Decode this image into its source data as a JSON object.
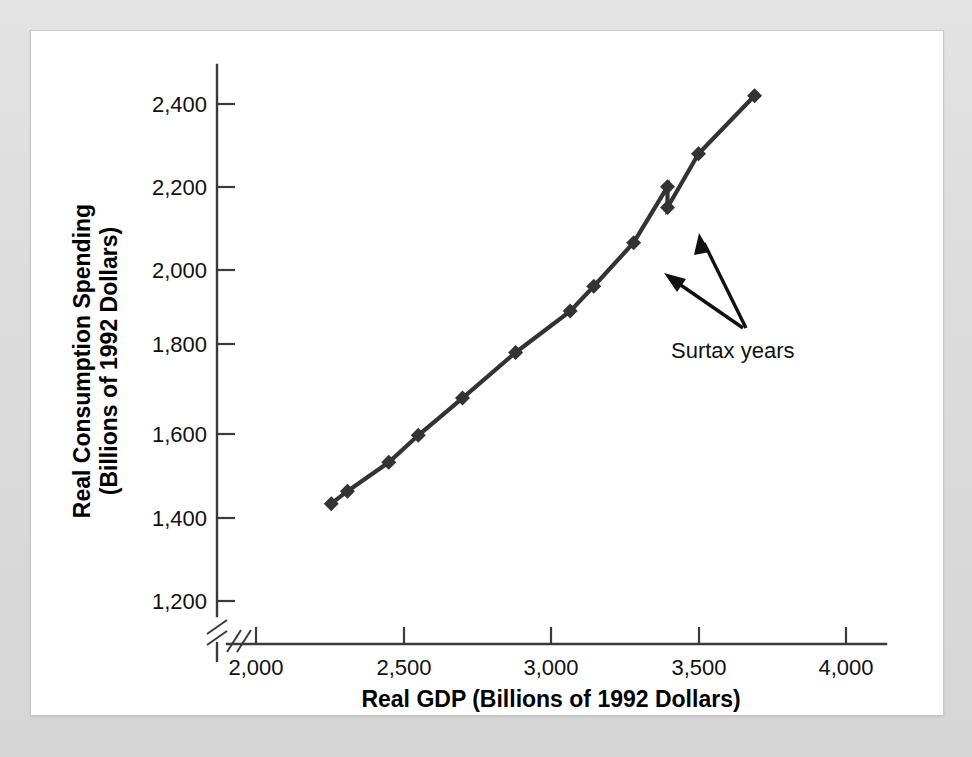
{
  "figure": {
    "background_color": "#d9d9d9",
    "panel_color": "#ffffff",
    "series_color": "#333333"
  },
  "axes": {
    "x_title": "Real GDP (Billions of 1992 Dollars)",
    "y_title_line1": "Real Consumption Spending",
    "y_title_line2": "(Billions of 1992 Dollars)",
    "x_ticks": [
      "2,000",
      "2,500",
      "3,000",
      "3,500",
      "4,000"
    ],
    "y_ticks": [
      "2,400",
      "2,200",
      "2,000",
      "1,800",
      "1,600",
      "1,400",
      "1,200"
    ]
  },
  "annotations": [
    {
      "text": "Surtax years"
    }
  ],
  "chart_data": {
    "type": "line",
    "title": "",
    "xlabel": "Real GDP (Billions of 1992 Dollars)",
    "ylabel": "Real Consumption Spending (Billions of 1992 Dollars)",
    "xlim": [
      2000,
      4000
    ],
    "ylim": [
      1200,
      2500
    ],
    "x_ticks": [
      2000,
      2500,
      3000,
      3500,
      4000
    ],
    "y_ticks": [
      1200,
      1400,
      1600,
      1800,
      2000,
      2200,
      2400
    ],
    "axis_break": {
      "x": true,
      "y": true
    },
    "grid": false,
    "legend": "none",
    "marker": "diamond",
    "series": [
      {
        "name": "Consumption function",
        "x": [
          2255,
          2310,
          2450,
          2550,
          2700,
          2880,
          3065,
          3145,
          3280,
          3395,
          3395,
          3500,
          3690
        ],
        "y": [
          1435,
          1465,
          1535,
          1600,
          1690,
          1800,
          1900,
          1960,
          2065,
          2200,
          2150,
          2280,
          2420
        ]
      }
    ],
    "annotations": [
      {
        "text": "Surtax years",
        "points_to": [
          {
            "x": 3280,
            "y": 2065
          },
          {
            "x": 3395,
            "y": 2150
          }
        ]
      }
    ]
  }
}
